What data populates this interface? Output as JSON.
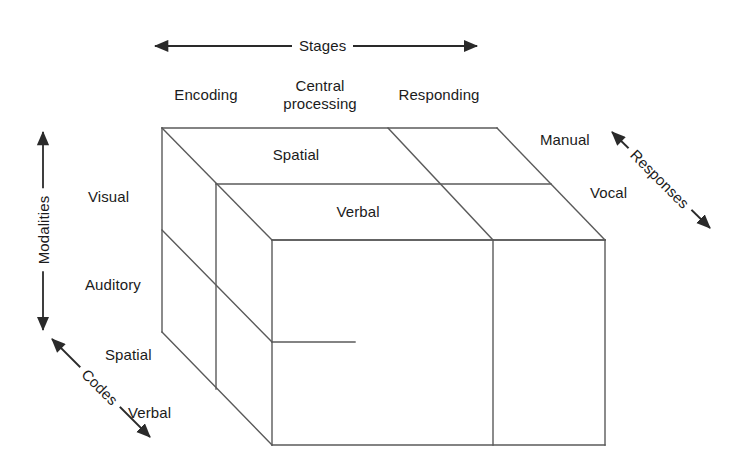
{
  "diagram": {
    "line_color": "#5a5a5a",
    "text_color": "#1b1b1b",
    "background_color": "#ffffff",
    "axes": [
      {
        "id": "stages",
        "label": "Stages",
        "direction": "horizontal",
        "arrowheads": "both"
      },
      {
        "id": "modalities",
        "label": "Modalities",
        "direction": "vertical",
        "arrowheads": "both"
      },
      {
        "id": "codes",
        "label": "Codes",
        "direction": "diagonal-down-right",
        "arrowheads": "both"
      },
      {
        "id": "responses",
        "label": "Responses",
        "direction": "diagonal-down-right",
        "arrowheads": "both"
      }
    ],
    "stages": [
      {
        "id": "encoding",
        "label": "Encoding"
      },
      {
        "id": "central-processing",
        "label": "Central\nprocessing",
        "line1": "Central",
        "line2": "processing"
      },
      {
        "id": "responding",
        "label": "Responding"
      }
    ],
    "modalities": [
      {
        "id": "visual",
        "label": "Visual"
      },
      {
        "id": "auditory",
        "label": "Auditory"
      }
    ],
    "codes": [
      {
        "id": "code-spatial",
        "label": "Spatial"
      },
      {
        "id": "code-verbal",
        "label": "Verbal"
      }
    ],
    "top_face_codes": [
      {
        "id": "top-spatial",
        "label": "Spatial"
      },
      {
        "id": "top-verbal",
        "label": "Verbal"
      }
    ],
    "responses": [
      {
        "id": "manual",
        "label": "Manual"
      },
      {
        "id": "vocal",
        "label": "Vocal"
      }
    ]
  }
}
